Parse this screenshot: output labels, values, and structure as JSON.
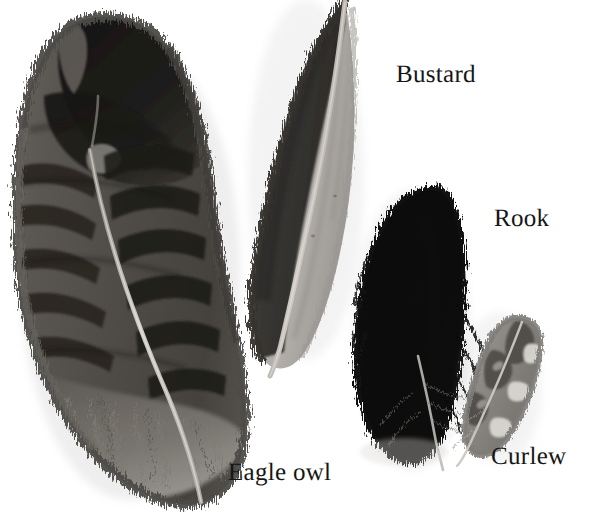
{
  "image": {
    "kind": "photographic-plate",
    "subject": "bird feathers",
    "background_color": "#ffffff",
    "width": 591,
    "height": 517
  },
  "labels": [
    {
      "id": "bustard",
      "text": "Bustard",
      "x": 396,
      "y": 62,
      "font_size": 25,
      "color": "#161616"
    },
    {
      "id": "rook",
      "text": "Rook",
      "x": 494,
      "y": 206,
      "font_size": 25,
      "color": "#161616"
    },
    {
      "id": "curlew",
      "text": "Curlew",
      "x": 491,
      "y": 444,
      "font_size": 25,
      "color": "#161616"
    },
    {
      "id": "eagleowl",
      "text": "Eagle owl",
      "x": 228,
      "y": 460,
      "font_size": 25,
      "color": "#161616"
    }
  ],
  "specimens": [
    {
      "id": "eagle-owl-feather",
      "label": "Eagle owl",
      "description": "Large barred body feather, dark blotchy bars over mid-grey vane, fluffy downy base, pale curving rachis",
      "position": "left",
      "colors": {
        "vane": "#55524e",
        "bars": "#1c1a18",
        "down": "#6e6b66",
        "rachis": "#cdc9c2"
      },
      "bbox": [
        8,
        14,
        250,
        508
      ]
    },
    {
      "id": "bustard-feather",
      "label": "Bustard",
      "description": "Long two-tone flight feather, dark left vane and pale grey right vane, tip cropped at top edge, tapers to thin pale shaft",
      "position": "centre",
      "colors": {
        "outer_vane": "#3b3936",
        "inner_vane": "#a9a6a1",
        "rachis": "#c2bdb6"
      },
      "bbox": [
        236,
        0,
        352,
        378
      ]
    },
    {
      "id": "rook-feather",
      "label": "Rook",
      "description": "Solid glossy black feather with rounded tip and wispy shaft trailing to lower right",
      "position": "right-centre",
      "colors": {
        "vane": "#0a0a0a",
        "edge": "#2a2a2a",
        "rachis": "#9b9893"
      },
      "bbox": [
        352,
        182,
        470,
        470
      ]
    },
    {
      "id": "curlew-feather",
      "label": "Curlew",
      "description": "Small mottled grey feather with pale notches along the outer edge and slender pale shaft",
      "position": "far-right",
      "colors": {
        "vane": "#8d8a85",
        "markings": "#4a4844",
        "notches": "#d6d3ce",
        "rachis": "#c6c2bb"
      },
      "bbox": [
        452,
        312,
        546,
        462
      ]
    }
  ]
}
